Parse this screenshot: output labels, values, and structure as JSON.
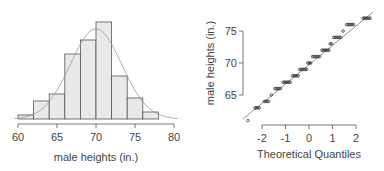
{
  "chart_data": [
    {
      "type": "bar",
      "title": "",
      "xlabel": "male heights (in.)",
      "ylabel": "",
      "bin_edges": [
        60,
        62,
        64,
        66,
        68,
        70,
        72,
        74,
        76,
        78
      ],
      "categories": [
        "60-62",
        "62-64",
        "64-66",
        "66-68",
        "68-70",
        "70-72",
        "72-74",
        "74-76",
        "76-78"
      ],
      "values": [
        4,
        18,
        25,
        65,
        79,
        97,
        43,
        21,
        7
      ],
      "value_units": "relative bar height (px)",
      "overlay": "normal density curve, mean ~70",
      "xticks": [
        "60",
        "65",
        "70",
        "75",
        "80"
      ],
      "xlim": [
        60,
        80
      ],
      "grid": false
    },
    {
      "type": "scatter",
      "title": "",
      "xlabel": "Theoretical Quantiles",
      "ylabel": "male heights (in.)",
      "xticks": [
        "-2",
        "-1",
        "0",
        "1",
        "2"
      ],
      "yticks": [
        "65",
        "70",
        "75"
      ],
      "xlim": [
        -2.7,
        2.7
      ],
      "ylim": [
        61,
        78
      ],
      "reference_line": "y = 70 + 3.3*x",
      "points_description": "Normal Q-Q plot; heights recorded to whole inches form horizontal clusters along the line from about (-2.6, 61.5) to (2.6, 77)",
      "grid": false
    }
  ],
  "left": {
    "xlabel": "male heights (in.)",
    "ticks": [
      "60",
      "65",
      "70",
      "75",
      "80"
    ]
  },
  "right": {
    "xlabel": "Theoretical Quantiles",
    "ylabel": "male heights (in.)",
    "xticks": [
      "-2",
      "-1",
      "0",
      "1",
      "2"
    ],
    "yticks": [
      "65",
      "70",
      "75"
    ]
  }
}
